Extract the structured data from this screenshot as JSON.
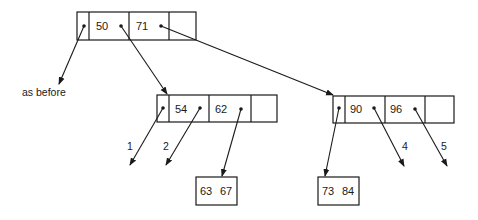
{
  "diagram": {
    "title": "",
    "root_node": {
      "keys": [
        "50",
        "71"
      ]
    },
    "left_child": {
      "keys": [
        "54",
        "62"
      ]
    },
    "right_child": {
      "keys": [
        "90",
        "96"
      ]
    },
    "leaf_left": {
      "keys": [
        "63",
        "67"
      ]
    },
    "leaf_right": {
      "keys": [
        "73",
        "84"
      ]
    },
    "labels": {
      "as_before": "as before",
      "pointer_1": "1",
      "pointer_2": "2",
      "pointer_4": "4",
      "pointer_5": "5"
    },
    "colors": {
      "stroke": "#1a1a1a",
      "background": "#ffffff"
    }
  }
}
